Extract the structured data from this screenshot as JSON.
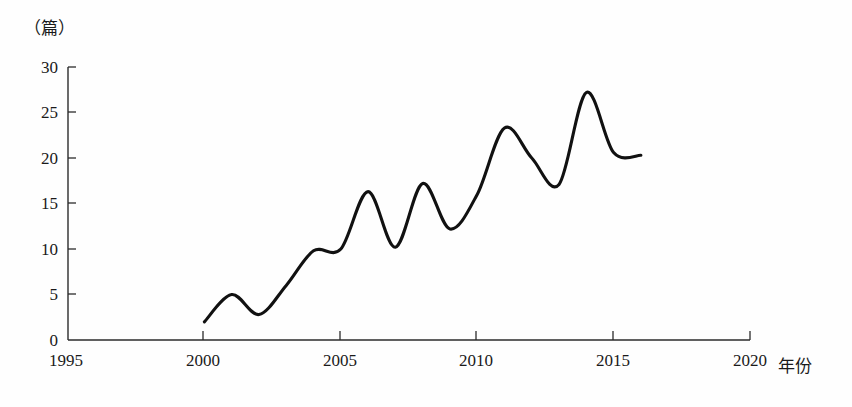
{
  "chart_data": {
    "type": "line",
    "title": "",
    "subtitle": "",
    "xlabel": "年份",
    "ylabel": "（篇）",
    "x": [
      2000,
      2001,
      2002,
      2003,
      2004,
      2005,
      2006,
      2007,
      2008,
      2009,
      2010,
      2011,
      2012,
      2013,
      2014,
      2015,
      2016
    ],
    "values": [
      2,
      5,
      2.8,
      6,
      9.8,
      10,
      16.3,
      10.2,
      17.2,
      12.2,
      16,
      23.3,
      20,
      17.1,
      27.2,
      20.6,
      20.3
    ],
    "series": [
      {
        "name": "发文量",
        "values": [
          2,
          5,
          2.8,
          6,
          9.8,
          10,
          16.3,
          10.2,
          17.2,
          12.2,
          16,
          23.3,
          20,
          17.1,
          27.2,
          20.6,
          20.3
        ]
      }
    ],
    "xlim": [
      1995,
      2020
    ],
    "ylim": [
      0,
      30
    ],
    "xticks": [
      1995,
      2000,
      2005,
      2010,
      2015,
      2020
    ],
    "yticks": [
      0,
      5,
      10,
      15,
      20,
      25,
      30
    ],
    "xtick_labels": [
      "1995",
      "2000",
      "2005",
      "2010",
      "2015",
      "2020"
    ],
    "ytick_labels": [
      "0",
      "5",
      "10",
      "15",
      "20",
      "25",
      "30"
    ],
    "grid": false,
    "legend": false,
    "legend_position": "none",
    "line_color": "#111111",
    "axis_color": "#2b2b2b",
    "smoothing": "spline",
    "annotations": []
  },
  "axes": {
    "y_unit_label": "（篇）",
    "x_axis_title": "年份"
  },
  "colors": {
    "background": "#fefefe",
    "line": "#111111",
    "axis": "#2b2b2b",
    "text": "#1a1a1a"
  }
}
